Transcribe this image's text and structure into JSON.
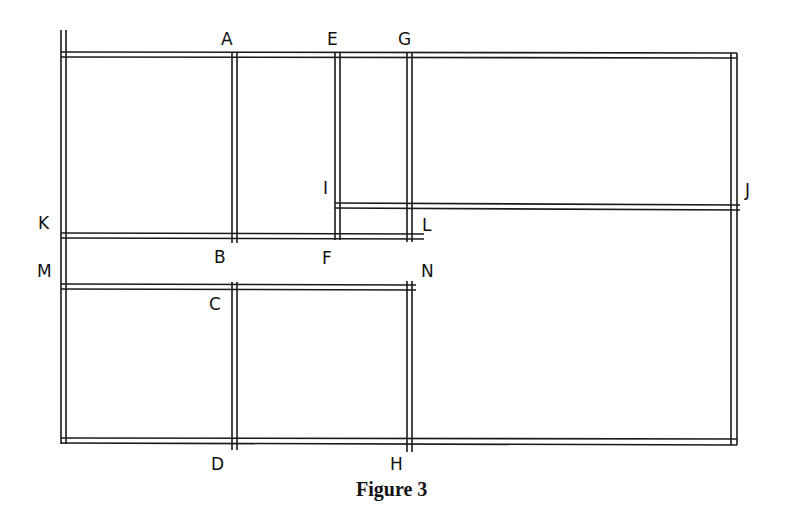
{
  "figure": {
    "caption": "Figure 3",
    "stroke_color": "#1a1a1a",
    "background": "#ffffff"
  },
  "labels": {
    "A": "A",
    "B": "B",
    "C": "C",
    "D": "D",
    "E": "E",
    "F": "F",
    "G": "G",
    "H": "H",
    "I": "I",
    "J": "J",
    "K": "K",
    "L": "L",
    "M": "M",
    "N": "N"
  },
  "walls": [
    {
      "name": "outer-top",
      "from": "top-left",
      "to": "top-right"
    },
    {
      "name": "outer-left",
      "from": "top-left",
      "to": "bottom-left"
    },
    {
      "name": "outer-right",
      "from": "top-right",
      "to": "bottom-right"
    },
    {
      "name": "outer-bottom",
      "from": "bottom-left",
      "to": "bottom-right"
    },
    {
      "name": "wall-AB",
      "from": "A",
      "to": "B"
    },
    {
      "name": "wall-CD",
      "from": "C",
      "to": "D"
    },
    {
      "name": "wall-EF",
      "from": "E",
      "to": "F"
    },
    {
      "name": "wall-GH",
      "from": "G",
      "to": "H"
    },
    {
      "name": "wall-IJ",
      "from": "I",
      "to": "J"
    },
    {
      "name": "wall-KL",
      "from": "K",
      "to": "L"
    },
    {
      "name": "wall-MN",
      "from": "M",
      "to": "N"
    }
  ]
}
